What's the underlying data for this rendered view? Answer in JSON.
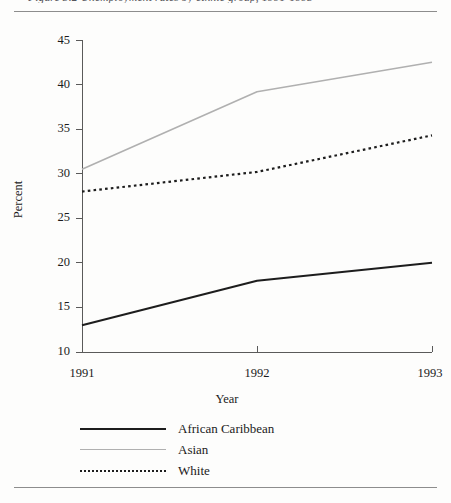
{
  "page": {
    "caption_sliver": "Figure 3.2  Unemployment rates by ethnic group, 1991-1993",
    "background_color": "#fdfdfc",
    "rule_color": "#8d8d8d"
  },
  "chart_data": {
    "type": "line",
    "title": "",
    "xlabel": "Year",
    "ylabel": "Percent",
    "x": [
      "1991",
      "1992",
      "1993"
    ],
    "categories": [
      "1991",
      "1992",
      "1993"
    ],
    "xlim": [
      1991,
      1993
    ],
    "ylim": [
      10,
      45
    ],
    "yticks": [
      10,
      15,
      20,
      25,
      30,
      35,
      40,
      45
    ],
    "xticks": [
      "1991",
      "1992",
      "1993"
    ],
    "grid": false,
    "legend_position": "bottom-left",
    "series": [
      {
        "name": "African Caribbean",
        "values": [
          13.0,
          18.0,
          20.0
        ],
        "style": "solid",
        "color": "#1d1d1d",
        "width": 2.0
      },
      {
        "name": "Asian",
        "values": [
          30.5,
          39.2,
          42.5
        ],
        "style": "solid",
        "color": "#b0b0b0",
        "width": 1.6
      },
      {
        "name": "White",
        "values": [
          28.0,
          30.2,
          34.3
        ],
        "style": "dotted",
        "color": "#1d1d1d",
        "width": 2.2
      }
    ]
  },
  "axis": {
    "y_tick_labels": [
      "45",
      "40",
      "35",
      "30",
      "25",
      "20",
      "15",
      "10"
    ],
    "x_tick_labels": [
      "1991",
      "1992",
      "1993"
    ],
    "y_axis_title": "Percent",
    "x_axis_title": "Year",
    "axis_color": "#5a5a5a"
  },
  "legend": {
    "items": [
      {
        "label": "African Caribbean",
        "swatch": "solid-dark-line-icon"
      },
      {
        "label": "Asian",
        "swatch": "solid-light-line-icon"
      },
      {
        "label": "White",
        "swatch": "dotted-dark-line-icon"
      }
    ]
  }
}
